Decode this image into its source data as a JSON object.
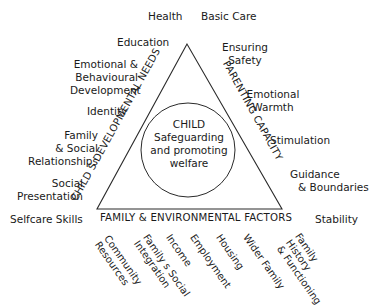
{
  "diagram": {
    "center": {
      "heading": "CHILD",
      "line1": "Safeguarding",
      "line2": "and promoting",
      "line3": "welfare"
    },
    "sides": {
      "left": "CHILD S DEVELOPMENTAL NEEDS",
      "right": "PARENTING CAPACITY",
      "bottom": "FAMILY & ENVIRONMENTAL FACTORS"
    },
    "developmental_needs": [
      {
        "label": "Health"
      },
      {
        "label": "Education"
      },
      {
        "label_lines": [
          "Emotional &",
          "Behavioural",
          "Development"
        ]
      },
      {
        "label": "Identity"
      },
      {
        "label_lines": [
          "Family",
          "& Social",
          "Relationships"
        ]
      },
      {
        "label_lines": [
          "Social",
          "Presentation"
        ]
      },
      {
        "label": "Selfcare Skills"
      }
    ],
    "parenting_capacity": [
      {
        "label": "Basic Care"
      },
      {
        "label_lines": [
          "Ensuring",
          "Safety"
        ]
      },
      {
        "label_lines": [
          "Emotional",
          "Warmth"
        ]
      },
      {
        "label": "Stimulation"
      },
      {
        "label_lines": [
          "Guidance",
          "& Boundaries"
        ]
      },
      {
        "label": "Stability"
      }
    ],
    "family_environmental_factors": [
      {
        "label_lines": [
          "Community",
          "Resources"
        ]
      },
      {
        "label_lines": [
          "Family s Social",
          "Integration"
        ]
      },
      {
        "label": "Income"
      },
      {
        "label": "Employment"
      },
      {
        "label": "Housing"
      },
      {
        "label": "Wider Family"
      },
      {
        "label_lines": [
          "Family",
          "History",
          "& Functioning"
        ]
      }
    ],
    "colors": {
      "line": "#2a2a2a",
      "text": "#1a1a1a",
      "background": "#ffffff"
    }
  }
}
